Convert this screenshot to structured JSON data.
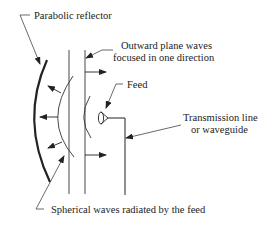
{
  "diagram": {
    "labels": {
      "reflector": "Parabolic reflector",
      "plane_waves_line1": "Outward plane waves",
      "plane_waves_line2": "focused in one direction",
      "feed": "Feed",
      "transmission_line1": "Transmission line",
      "transmission_line2": "or waveguide",
      "spherical_waves": "Spherical waves radiated by the feed"
    },
    "colors": {
      "line": "#222222",
      "background": "#ffffff"
    }
  }
}
